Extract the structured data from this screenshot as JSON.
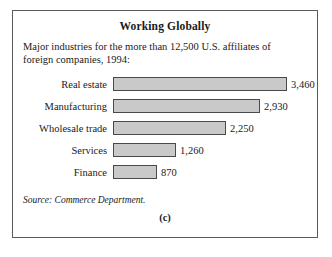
{
  "figure": {
    "title": "Working Globally",
    "subtitle": "Major industries for the more than 12,500 U.S. affiliates of foreign companies, 1994:",
    "source": "Source: Commerce Department.",
    "panel_caption": "(c)",
    "border_color": "#5a5a5a"
  },
  "chart_data": {
    "type": "bar",
    "orientation": "horizontal",
    "title": "Working Globally",
    "subtitle": "Major industries for the more than 12,500 U.S. affiliates of foreign companies, 1994:",
    "xlabel": "",
    "ylabel": "",
    "categories": [
      "Real estate",
      "Manufacturing",
      "Wholesale trade",
      "Services",
      "Finance"
    ],
    "values": [
      3460,
      2930,
      2250,
      1260,
      870
    ],
    "value_labels": [
      "3,460",
      "2,930",
      "2,250",
      "1,260",
      "870"
    ],
    "xlim": [
      0,
      3460
    ],
    "grid": false,
    "legend": null,
    "bar_fill_color": "#c9c9c9",
    "bar_border_color": "#4a4a4a",
    "source": "Source: Commerce Department."
  }
}
